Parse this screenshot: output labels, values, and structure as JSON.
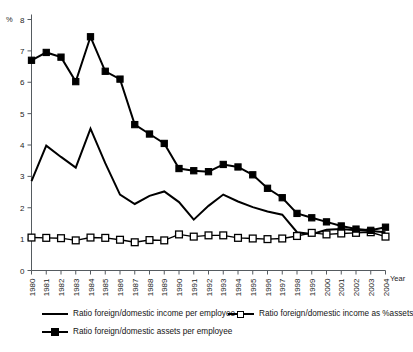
{
  "chart_data": {
    "type": "line",
    "title": "",
    "subtitle": "",
    "xlabel": "Year",
    "ylabel": "%",
    "ylim": [
      0,
      8
    ],
    "xlim": [
      1980,
      2004
    ],
    "grid": false,
    "legend_position": "bottom-left",
    "yticks": [
      0,
      1,
      2,
      3,
      4,
      5,
      6,
      7,
      8
    ],
    "ytick_labels": [
      "0",
      "1",
      "2",
      "3",
      "4",
      "5",
      "6",
      "7",
      "8"
    ],
    "categories": [
      1980,
      1981,
      1982,
      1983,
      1984,
      1985,
      1986,
      1987,
      1988,
      1989,
      1990,
      1991,
      1992,
      1993,
      1994,
      1995,
      1996,
      1997,
      1998,
      1999,
      2000,
      2001,
      2002,
      2003,
      2004
    ],
    "xtick_labels": [
      "1980",
      "1981",
      "1982",
      "1983",
      "1984",
      "1985",
      "1986",
      "1987",
      "1988",
      "1989",
      "1990",
      "1991",
      "1992",
      "1993",
      "1994",
      "1995",
      "1996",
      "1997",
      "1998",
      "1999",
      "2000",
      "2001",
      "2002",
      "2003",
      "2004"
    ],
    "series": [
      {
        "name": "Ratio foreign/domestic income per employee",
        "marker": "none",
        "line": "solid",
        "color": "#000000",
        "values": [
          2.85,
          3.98,
          3.62,
          3.28,
          4.52,
          3.42,
          2.42,
          2.12,
          2.38,
          2.52,
          2.18,
          1.62,
          2.06,
          2.42,
          2.2,
          2.02,
          1.88,
          1.78,
          1.22,
          1.16,
          1.3,
          1.32,
          1.28,
          1.26,
          1.22
        ]
      },
      {
        "name": "Ratio foreign/domestic income as %assets",
        "marker": "open-square",
        "line": "solid",
        "color": "#000000",
        "values": [
          1.05,
          1.04,
          1.03,
          0.96,
          1.05,
          1.04,
          0.98,
          0.9,
          0.97,
          0.96,
          1.15,
          1.08,
          1.12,
          1.12,
          1.04,
          1.02,
          1.0,
          1.02,
          1.1,
          1.2,
          1.15,
          1.18,
          1.2,
          1.22,
          1.08
        ]
      },
      {
        "name": "Ratio foreign/domestic assets per employee",
        "marker": "filled-square",
        "line": "solid",
        "color": "#000000",
        "values": [
          6.7,
          6.95,
          6.8,
          6.02,
          7.45,
          6.35,
          6.1,
          4.65,
          4.35,
          4.05,
          3.25,
          3.18,
          3.15,
          3.38,
          3.3,
          3.05,
          2.62,
          2.32,
          1.82,
          1.68,
          1.55,
          1.42,
          1.32,
          1.28,
          1.38
        ]
      }
    ]
  },
  "legend": {
    "items": [
      {
        "label": "Ratio foreign/domestic income per employee",
        "marker": "line"
      },
      {
        "label": "Ratio foreign/domestic income as %assets",
        "marker": "open-square"
      },
      {
        "label": "Ratio foreign/domestic assets per employee",
        "marker": "filled-square"
      }
    ]
  },
  "axis": {
    "y_unit_label": "%",
    "x_axis_title": "Year"
  }
}
